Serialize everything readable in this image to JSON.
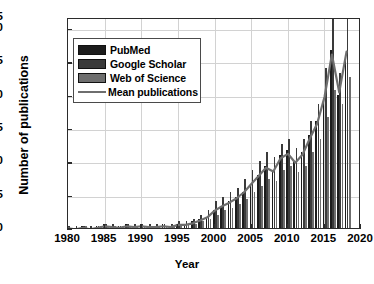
{
  "chart_data": {
    "type": "bar",
    "title": "",
    "xlabel": "Year",
    "ylabel": "Number of publications",
    "xlim": [
      1980,
      2020
    ],
    "ylim": [
      0,
      95
    ],
    "yticks": [
      0,
      15,
      30,
      45,
      60,
      75,
      90,
      95
    ],
    "xticks": [
      1980,
      1985,
      1990,
      1995,
      2000,
      2005,
      2010,
      2015,
      2020
    ],
    "grid": true,
    "legend_position": "upper left",
    "categories": [
      1980,
      1981,
      1982,
      1983,
      1984,
      1985,
      1986,
      1987,
      1988,
      1989,
      1990,
      1991,
      1992,
      1993,
      1994,
      1995,
      1996,
      1997,
      1998,
      1999,
      2000,
      2001,
      2002,
      2003,
      2004,
      2005,
      2006,
      2007,
      2008,
      2009,
      2010,
      2011,
      2012,
      2013,
      2014,
      2015,
      2016,
      2017,
      2018
    ],
    "series": [
      {
        "name": "PubMed",
        "color": "#1c1c1c",
        "values": [
          1,
          0,
          1,
          0,
          1,
          2,
          1,
          1,
          2,
          1,
          2,
          1,
          1,
          2,
          1,
          2,
          2,
          3,
          4,
          5,
          8,
          10,
          12,
          14,
          16,
          20,
          24,
          28,
          26,
          33,
          35,
          30,
          34,
          42,
          48,
          58,
          80,
          60,
          78
        ]
      },
      {
        "name": "Google Scholar",
        "color": "#3a3a3a",
        "values": [
          1,
          1,
          1,
          1,
          1,
          2,
          2,
          1,
          2,
          2,
          2,
          2,
          2,
          2,
          2,
          3,
          3,
          4,
          6,
          8,
          12,
          14,
          16,
          18,
          22,
          26,
          30,
          34,
          32,
          38,
          40,
          36,
          40,
          48,
          56,
          72,
          95,
          70,
          95
        ]
      },
      {
        "name": "Web of Science",
        "color": "#6e6e6e",
        "values": [
          0,
          0,
          1,
          0,
          1,
          1,
          1,
          1,
          1,
          1,
          1,
          1,
          1,
          1,
          1,
          2,
          2,
          2,
          3,
          4,
          6,
          8,
          9,
          11,
          13,
          16,
          19,
          22,
          21,
          26,
          28,
          25,
          28,
          34,
          40,
          50,
          62,
          56,
          68
        ]
      }
    ],
    "mean_series": {
      "name": "Mean publications",
      "color": "#6e6e6e",
      "values": [
        0.7,
        0.3,
        1,
        0.3,
        1,
        1.7,
        1.3,
        1,
        1.7,
        1.3,
        1.7,
        1.3,
        1.3,
        1.7,
        1.3,
        2.3,
        2.3,
        3,
        4.3,
        5.7,
        8.7,
        10.7,
        12.3,
        14.3,
        17,
        20.7,
        24.3,
        28,
        26.3,
        32.3,
        34.3,
        30.3,
        34,
        41.3,
        48,
        60,
        79,
        62,
        80.3
      ]
    }
  },
  "legend": {
    "items": [
      {
        "label": "PubMed",
        "type": "swatch"
      },
      {
        "label": "Google Scholar",
        "type": "swatch"
      },
      {
        "label": "Web of Science",
        "type": "swatch"
      },
      {
        "label": "Mean publications",
        "type": "line"
      }
    ]
  },
  "axes": {
    "x_label": "Year",
    "y_label": "Number of publications",
    "x_tick_labels": [
      "1980",
      "1985",
      "1990",
      "1995",
      "2000",
      "2005",
      "2010",
      "2015",
      "2020"
    ],
    "y_tick_labels": [
      "0",
      "15",
      "30",
      "45",
      "60",
      "75",
      "90",
      "95"
    ]
  },
  "colors": {
    "pubmed": "#1c1c1c",
    "google_scholar": "#3a3a3a",
    "web_of_science": "#6e6e6e",
    "mean_line": "#6e6e6e",
    "axis": "#2b2b2b",
    "grid": "#d2d2d2",
    "background": "#ffffff"
  }
}
